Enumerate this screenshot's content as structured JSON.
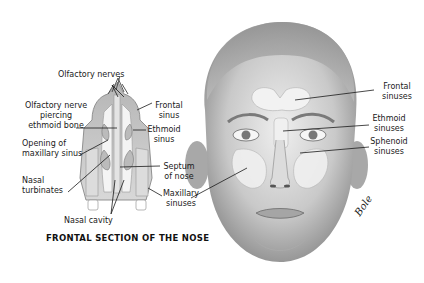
{
  "section_diagram": {
    "title": "FRONTAL SECTION OF THE NOSE",
    "labels": {
      "olfactory_nerves": "Olfactory nerves",
      "olfactory_nerve_piercing": [
        "Olfactory nerve",
        "piercing",
        "ethmoid bone"
      ],
      "opening_maxillary": [
        "Opening of",
        "maxillary sinus"
      ],
      "nasal_turbinates": [
        "Nasal",
        "turbinates"
      ],
      "nasal_cavity": "Nasal cavity",
      "frontal_sinus": [
        "Frontal",
        "sinus"
      ],
      "ethmoid_sinus": [
        "Ethmoid",
        "sinus"
      ],
      "septum": [
        "Septum",
        "of nose"
      ],
      "maxillary_sinuses": [
        "Maxillary",
        "sinuses"
      ]
    }
  },
  "face_diagram": {
    "labels": {
      "frontal_sinuses": [
        "Frontal",
        "sinuses"
      ],
      "ethmoid_sinuses": [
        "Ethmoid",
        "sinuses"
      ],
      "sphenoid_sinuses": [
        "Sphenoid",
        "sinuses"
      ]
    },
    "signature": "Bole"
  },
  "colors": {
    "skin_light": "#e6e6e6",
    "skin_shade": "#9a9a9a",
    "sinus_fill": "#f2f2f2",
    "line": "#1a1a1a"
  }
}
